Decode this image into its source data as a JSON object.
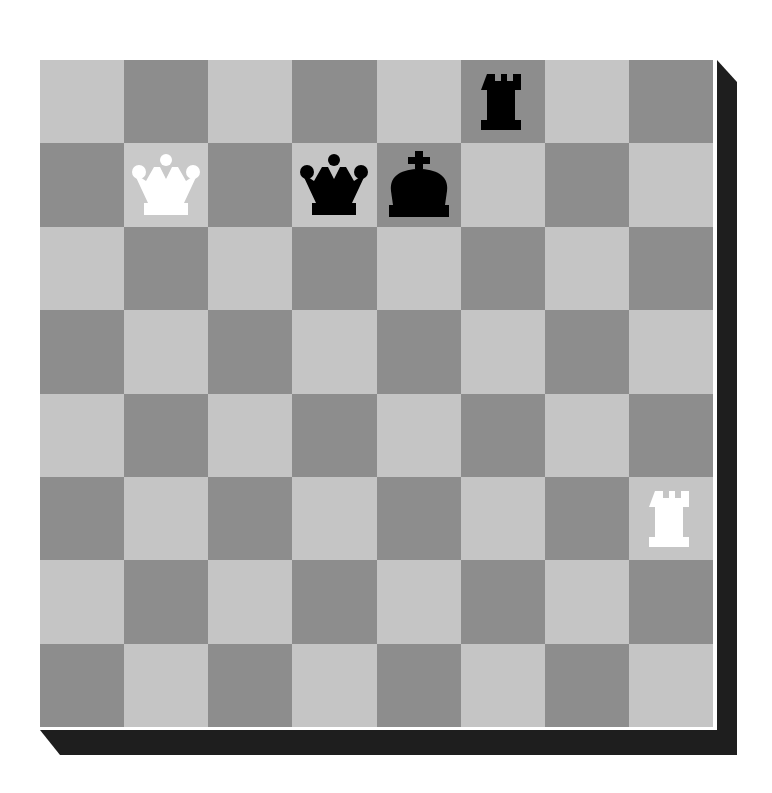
{
  "board": {
    "orientation": "white-bottom",
    "files": [
      "a",
      "b",
      "c",
      "d",
      "e",
      "f",
      "g",
      "h"
    ],
    "ranks": [
      8,
      7,
      6,
      5,
      4,
      3,
      2,
      1
    ],
    "colors": {
      "light": "#c5c5c5",
      "dark": "#8d8d8d",
      "shadow": "#1e1e1e",
      "white_piece": "#ffffff",
      "black_piece": "#000000"
    },
    "highlighted_squares": [
      "b7"
    ],
    "pieces": [
      {
        "square": "f8",
        "type": "rook",
        "color": "black",
        "icon": "black-rook-icon"
      },
      {
        "square": "b7",
        "type": "queen",
        "color": "white",
        "icon": "white-queen-icon"
      },
      {
        "square": "d7",
        "type": "queen",
        "color": "black",
        "icon": "black-queen-icon"
      },
      {
        "square": "e7",
        "type": "king",
        "color": "black",
        "icon": "black-king-icon"
      },
      {
        "square": "h3",
        "type": "rook",
        "color": "white",
        "icon": "white-rook-icon"
      }
    ]
  }
}
